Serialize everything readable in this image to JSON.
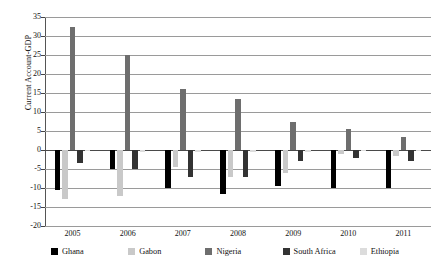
{
  "chart_data": {
    "type": "bar",
    "title": "",
    "subtitle": "",
    "xlabel": "",
    "ylabel": "Current Account-GDP",
    "categories": [
      "2005",
      "2006",
      "2007",
      "2008",
      "2009",
      "2010",
      "2011"
    ],
    "ylim": [
      -20,
      35
    ],
    "ytick_step": 5,
    "yticks": [
      35,
      30,
      25,
      20,
      15,
      10,
      5,
      0,
      -5,
      -10,
      -15,
      -20
    ],
    "ytick_labels": [
      "35",
      "30",
      "25",
      "20",
      "15",
      "10",
      "5",
      "0",
      "-5",
      "-10",
      "-15",
      "-20"
    ],
    "grid": true,
    "grid_axis": "y",
    "legend_position": "bottom",
    "orientation": "vertical",
    "series": [
      {
        "name": "Ghana",
        "color": "#000000",
        "values": [
          -10.5,
          -5.0,
          -10.0,
          -11.5,
          -9.5,
          -10.0,
          -10.0
        ]
      },
      {
        "name": "Gabon",
        "color": "#c9c9c9",
        "values": [
          -13.0,
          -12.0,
          -4.5,
          -7.0,
          -6.0,
          -1.0,
          -1.5
        ]
      },
      {
        "name": "Nigeria",
        "color": "#6e6e6e",
        "values": [
          32.5,
          25.0,
          16.0,
          13.5,
          7.5,
          5.5,
          3.5
        ]
      },
      {
        "name": "South Africa",
        "color": "#333333",
        "values": [
          -3.5,
          -5.0,
          -7.0,
          -7.0,
          -3.0,
          -2.0,
          -3.0
        ]
      },
      {
        "name": "Ethiopia",
        "color": "#dcdcdc",
        "values": [
          -0.3,
          -0.5,
          -0.5,
          -0.5,
          -0.4,
          -0.3,
          -0.3
        ]
      }
    ],
    "extra_series_note": "Gabon 2005 bar rendered at light gray; Nigeria 2005 is the tallest bar at 32.5"
  },
  "legend": {
    "items": [
      {
        "label": "Ghana",
        "color": "#000000"
      },
      {
        "label": "Gabon",
        "color": "#c9c9c9"
      },
      {
        "label": "Nigeria",
        "color": "#6e6e6e"
      },
      {
        "label": "South Africa",
        "color": "#333333"
      },
      {
        "label": "Ethiopia",
        "color": "#dcdcdc"
      }
    ]
  }
}
